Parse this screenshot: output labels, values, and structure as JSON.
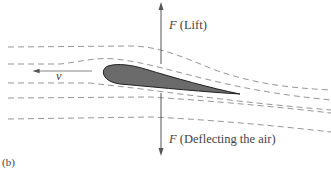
{
  "figure": {
    "panel_label": "(b)",
    "lift_symbol": "F",
    "lift_label": " (Lift)",
    "deflect_symbol": "F",
    "deflect_label": " (Deflecting the air)",
    "velocity_label": "v"
  },
  "colors": {
    "airfoil_fill": "#6b6b6b",
    "airfoil_stroke": "#222222",
    "streamline": "#8a8a8a",
    "arrow": "#555555",
    "text": "#444444"
  }
}
